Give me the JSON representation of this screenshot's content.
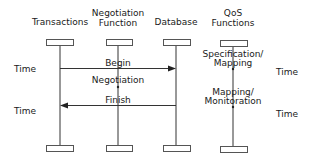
{
  "diagram": {
    "type": "sequence-diagram",
    "lifelines": [
      {
        "id": "transactions",
        "label": "Transactions"
      },
      {
        "id": "negotiation",
        "label_line1": "Negotiation",
        "label_line2": "Function"
      },
      {
        "id": "database",
        "label": "Database"
      },
      {
        "id": "qos",
        "label_line1": "QoS",
        "label_line2": "Functions"
      }
    ],
    "messages": [
      {
        "label": "Begin",
        "from": "transactions",
        "to": "database"
      },
      {
        "label": "Finish",
        "from": "database",
        "to": "transactions"
      }
    ],
    "activities": [
      {
        "label": "Negotiation",
        "on": "negotiation"
      },
      {
        "label_line1": "Specification/",
        "label_line2": "Mapping",
        "on": "qos"
      },
      {
        "label_line1": "Mapping/",
        "label_line2": "Monitoration",
        "on": "qos"
      }
    ],
    "time_labels": {
      "left_top": "Time",
      "left_bottom": "Time",
      "right_top": "Time",
      "right_bottom": "Time"
    },
    "colors": {
      "line": "#333333",
      "box_border": "#555555",
      "box_fill": "#ffffff"
    }
  }
}
